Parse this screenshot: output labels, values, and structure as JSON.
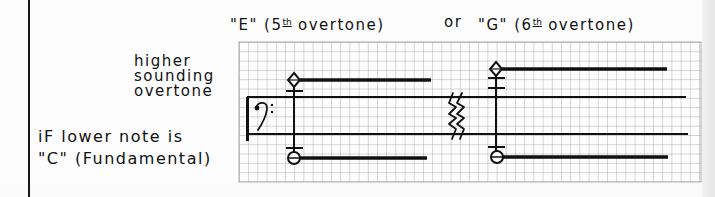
{
  "header": {
    "e_label": {
      "note": "\"E\"",
      "open_paren": "(5",
      "ordinal_suffix": "th",
      "rest": "overtone)"
    },
    "or_label": "or",
    "g_label": {
      "note": "\"G\"",
      "open_paren": "(6",
      "ordinal_suffix": "th",
      "rest": "overtone)"
    }
  },
  "annotations": {
    "upper_note_lines": [
      "higher",
      "sounding",
      "overtone"
    ],
    "lower_note_lines": [
      "iF lower note is",
      "\"C\" (Fundamental)"
    ]
  },
  "staff": {
    "clef": "bass-clef",
    "clef_glyph": "𝄢",
    "lines": 2,
    "break_marks": "double-zigzag"
  },
  "chords": [
    {
      "upper_note": "E",
      "upper_overtone": "5th overtone",
      "upper_notehead": "diamond",
      "lower_note": "C",
      "lower_notehead": "circle",
      "upper_ledger_lines": 1,
      "lower_ledger_lines": 1
    },
    {
      "upper_note": "G",
      "upper_overtone": "6th overtone",
      "upper_notehead": "diamond",
      "lower_note": "C",
      "lower_notehead": "circle",
      "upper_ledger_lines": 2,
      "lower_ledger_lines": 1
    }
  ],
  "colors": {
    "ink": "#111111",
    "grid": "#9a9a9a",
    "paper": "#fdfdfd"
  }
}
